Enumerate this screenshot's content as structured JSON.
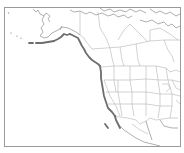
{
  "map": {
    "region": "Western North America",
    "highlight": "Pacific coastline range (Aleutians, Alaska, British Columbia, US West Coast, Baja California)",
    "colors": {
      "background": "#ffffff",
      "frame": "#9a9a9a",
      "boundaries": "#b4b4b4",
      "coastline": "#8c8c8c",
      "highlight": "#6e6e6e"
    }
  }
}
